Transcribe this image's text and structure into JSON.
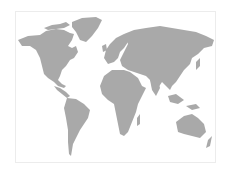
{
  "map": {
    "type": "world-map",
    "projection": "equirectangular-like",
    "land_color": "#a9a9a9",
    "background_color": "#ffffff",
    "frame_color": "#ececec",
    "regions": [
      {
        "name": "North America"
      },
      {
        "name": "Greenland"
      },
      {
        "name": "South America"
      },
      {
        "name": "Europe"
      },
      {
        "name": "Africa"
      },
      {
        "name": "Asia"
      },
      {
        "name": "Australia"
      }
    ]
  }
}
